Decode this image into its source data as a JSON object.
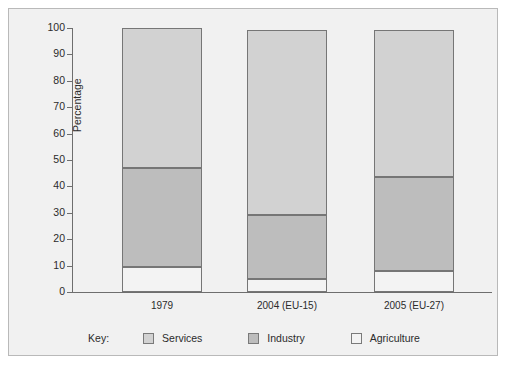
{
  "chart_data": {
    "type": "bar",
    "subtype": "stacked-100-percent",
    "title": "",
    "xlabel": "",
    "ylabel": "Percentage",
    "ylim": [
      0,
      100
    ],
    "yticks": [
      0,
      10,
      20,
      30,
      40,
      50,
      60,
      70,
      80,
      90,
      100
    ],
    "grid": false,
    "legend_position": "bottom",
    "legend_title": "Key:",
    "categories": [
      "1979",
      "2004 (EU-15)",
      "2005 (EU-27)"
    ],
    "series": [
      {
        "name": "Agriculture",
        "color": "#f3f3f3",
        "values": [
          9.5,
          4.9,
          8.0
        ]
      },
      {
        "name": "Industry",
        "color": "#bdbdbd",
        "values": [
          37.5,
          24.3,
          35.6
        ]
      },
      {
        "name": "Services",
        "color": "#d2d2d2",
        "values": [
          53.0,
          70.1,
          55.7
        ]
      }
    ],
    "cumulative_tops": {
      "Agriculture": [
        9.5,
        4.9,
        8.0
      ],
      "Industry": [
        47.0,
        29.2,
        43.6
      ],
      "Services": [
        100.0,
        99.3,
        99.3
      ]
    }
  },
  "axis": {
    "y_title": "Percentage",
    "tick_labels": [
      "100",
      "90",
      "80",
      "70",
      "60",
      "50",
      "40",
      "30",
      "20",
      "10",
      "0"
    ],
    "category_labels": [
      "1979",
      "2004 (EU-15)",
      "2005 (EU-27)"
    ]
  },
  "legend": {
    "title": "Key:",
    "entries": [
      {
        "label": "Services",
        "color": "#d2d2d2"
      },
      {
        "label": "Industry",
        "color": "#bdbdbd"
      },
      {
        "label": "Agriculture",
        "color": "#f3f3f3"
      }
    ]
  }
}
